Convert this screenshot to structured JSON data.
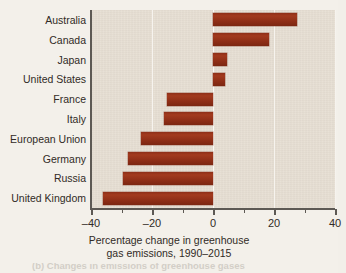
{
  "chart_data": {
    "type": "bar",
    "orientation": "horizontal",
    "title": "",
    "xlabel": "Percentage change in greenhouse gas emissions, 1990–2015",
    "ylabel": "",
    "xlim": [
      -40,
      40
    ],
    "xticks": [
      -40,
      -20,
      0,
      20,
      40
    ],
    "xticklabels": [
      "–40",
      "–20",
      "0",
      "20",
      "40"
    ],
    "minor_xticks": [
      -30,
      -10,
      10,
      30
    ],
    "grid": "vertical gridlines at major ticks, white on tan background",
    "legend": "none",
    "bar_color": "#8c2d16",
    "plot_background": "#e6ded2",
    "categories": [
      "Australia",
      "Canada",
      "Japan",
      "United States",
      "France",
      "Italy",
      "European Union",
      "Germany",
      "Russia",
      "United Kingdom"
    ],
    "values": [
      27.5,
      18.5,
      4.5,
      4.0,
      -15.0,
      -16.0,
      -23.5,
      -28.0,
      -29.5,
      -36.0
    ]
  },
  "axis_title": {
    "line1": "Percentage change in greenhouse",
    "line2": "gas emissions, 1990–2015"
  },
  "caption": {
    "clipped_line": "(b) Changes in emissions of greenhouse gases"
  }
}
